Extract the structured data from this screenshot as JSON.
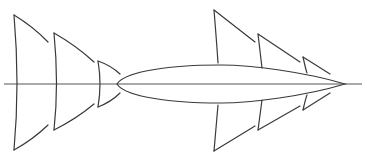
{
  "diagram": {
    "type": "line-drawing",
    "colors": {
      "background": "#ffffff",
      "stroke": "#3a3a3a",
      "axis": "#555555"
    },
    "axis": {
      "y": 84,
      "x_start": 4,
      "x_end": 362
    },
    "body": {
      "cx": 231,
      "cy": 84,
      "rx": 114,
      "ry": 19,
      "tip_x": 345
    },
    "left_segments": [
      {
        "x": 14,
        "top": 15,
        "bottom": 150,
        "tail_x": 48,
        "tail_top": 42,
        "tail_bottom": 125
      },
      {
        "x": 54,
        "top": 33,
        "bottom": 130,
        "tail_x": 94,
        "tail_top": 62,
        "tail_bottom": 104
      },
      {
        "x": 98,
        "top": 61,
        "bottom": 107,
        "tail_x": 120,
        "tail_top": 74,
        "tail_bottom": 93
      }
    ],
    "right_segments": [
      {
        "x": 214,
        "top": 10,
        "bottom": 151,
        "tail_x": 255,
        "tail_top": 42,
        "tail_bottom": 126
      },
      {
        "x": 258,
        "top": 34,
        "bottom": 130,
        "tail_x": 300,
        "tail_top": 62,
        "tail_bottom": 106
      },
      {
        "x": 303,
        "top": 57,
        "bottom": 110,
        "tail_x": 330,
        "tail_top": 74,
        "tail_bottom": 93
      }
    ]
  }
}
